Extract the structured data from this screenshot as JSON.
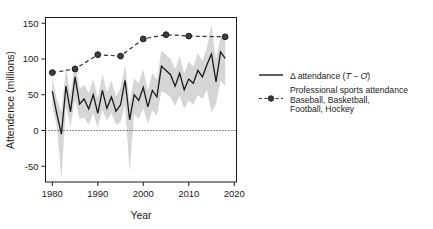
{
  "chart_data": {
    "type": "line",
    "title": "",
    "xlabel": "Year",
    "ylabel": "Attendence (millions)",
    "xlim": [
      1978.5,
      2020.5
    ],
    "ylim": [
      -72,
      158
    ],
    "xticks": [
      1980,
      1990,
      2000,
      2010,
      2020
    ],
    "xtick_labels": [
      "1980",
      "1990",
      "2000",
      "2010",
      "2020"
    ],
    "yticks": [
      -50,
      0,
      50,
      100,
      150
    ],
    "ytick_labels": [
      "-50",
      "0",
      "50",
      "100",
      "150"
    ],
    "grid": false,
    "zero_reference_line": 0,
    "legend_position": "right-outside",
    "series": [
      {
        "name": "delta-attendance",
        "legend_label_plain": "Δ attendance (T̄ − Ō)",
        "legend_label_prefix": "Δ attendance (",
        "legend_label_sym1": "T",
        "legend_label_mid": " − ",
        "legend_label_sym2": "O",
        "legend_label_suffix": ")",
        "style": "solid",
        "color": "#1a1a1a",
        "band_color": "#d4d4d4",
        "x": [
          1980,
          1981,
          1982,
          1983,
          1984,
          1985,
          1986,
          1987,
          1988,
          1989,
          1990,
          1991,
          1992,
          1993,
          1994,
          1995,
          1996,
          1997,
          1998,
          1999,
          2000,
          2001,
          2002,
          2003,
          2004,
          2005,
          2006,
          2007,
          2008,
          2009,
          2010,
          2011,
          2012,
          2013,
          2014,
          2015,
          2016,
          2017,
          2018
        ],
        "values": [
          55,
          23,
          -5,
          62,
          26,
          75,
          37,
          44,
          30,
          50,
          24,
          56,
          31,
          47,
          27,
          36,
          70,
          15,
          50,
          42,
          60,
          33,
          56,
          47,
          90,
          84,
          78,
          62,
          80,
          57,
          72,
          66,
          84,
          75,
          92,
          107,
          68,
          110,
          101
        ],
        "band_low": [
          34,
          5,
          -70,
          34,
          6,
          44,
          16,
          18,
          8,
          24,
          4,
          29,
          14,
          24,
          8,
          12,
          36,
          -58,
          23,
          16,
          31,
          10,
          28,
          21,
          55,
          52,
          46,
          34,
          49,
          30,
          42,
          36,
          50,
          44,
          57,
          25,
          37,
          70,
          62
        ],
        "band_high": [
          74,
          44,
          26,
          88,
          50,
          96,
          58,
          64,
          52,
          72,
          45,
          79,
          54,
          70,
          48,
          59,
          92,
          40,
          73,
          66,
          86,
          56,
          80,
          71,
          112,
          106,
          100,
          86,
          104,
          80,
          96,
          90,
          108,
          98,
          116,
          148,
          99,
          131,
          126
        ]
      },
      {
        "name": "professional-sports-attendance",
        "legend_label_line1": "Professional sports attendance",
        "legend_label_line2": "Baseball, Basketball,",
        "legend_label_line3": "Football, Hockey",
        "style": "dashed",
        "marker": "filled-circle",
        "color": "#2b2b2b",
        "x": [
          1980,
          1985,
          1990,
          1995,
          2000,
          2005,
          2010,
          2018
        ],
        "values": [
          81,
          86,
          106,
          104,
          128,
          134,
          132,
          131
        ]
      }
    ]
  },
  "legend": {
    "entry1_key": "solid-line-key",
    "entry2_key": "dashed-line-marker-key"
  }
}
